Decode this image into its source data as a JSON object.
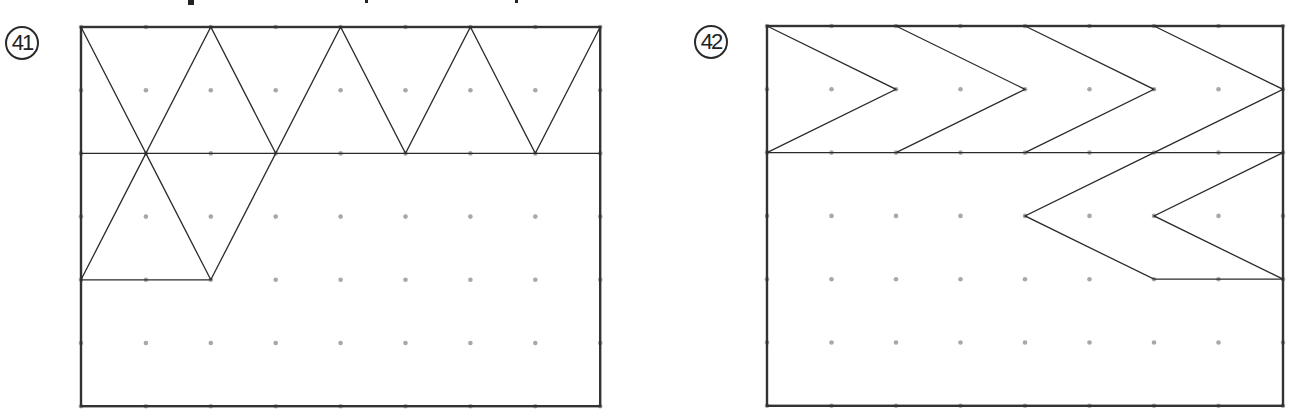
{
  "colors": {
    "line": "#2b2b2b",
    "dot": "#a8a8a8",
    "frame": "#333333",
    "background": "#ffffff"
  },
  "top_fragments": [
    {
      "x": 188,
      "y": 0,
      "w": 6,
      "h": 5
    },
    {
      "x": 365,
      "y": 0,
      "w": 3,
      "h": 3
    },
    {
      "x": 515,
      "y": 0,
      "w": 3,
      "h": 3
    }
  ],
  "problems": [
    {
      "number": "41",
      "label_pos": {
        "x": 5,
        "y": 26
      },
      "grid": {
        "origin_x": 81,
        "origin_y": 27,
        "dx": 64.9,
        "dy": 63.2,
        "cols": 9,
        "rows": 7
      },
      "polylines": [
        [
          [
            0,
            0
          ],
          [
            1,
            2
          ],
          [
            2,
            0
          ],
          [
            3,
            2
          ],
          [
            4,
            0
          ],
          [
            5,
            2
          ],
          [
            6,
            0
          ],
          [
            7,
            2
          ],
          [
            8,
            0
          ]
        ],
        [
          [
            0,
            2
          ],
          [
            8,
            2
          ]
        ],
        [
          [
            1,
            2
          ],
          [
            0,
            4
          ],
          [
            2,
            4
          ],
          [
            1,
            2
          ]
        ],
        [
          [
            2,
            4
          ],
          [
            3,
            2
          ]
        ]
      ]
    },
    {
      "number": "42",
      "label_pos": {
        "x": 694,
        "y": 25
      },
      "grid": {
        "origin_x": 767,
        "origin_y": 26,
        "dx": 64.5,
        "dy": 63.3,
        "cols": 9,
        "rows": 7
      },
      "polylines": [
        [
          [
            0,
            0
          ],
          [
            2,
            1
          ],
          [
            0,
            2
          ]
        ],
        [
          [
            2,
            0
          ],
          [
            4,
            1
          ],
          [
            2,
            2
          ]
        ],
        [
          [
            4,
            0
          ],
          [
            6,
            1
          ],
          [
            4,
            2
          ]
        ],
        [
          [
            6,
            0
          ],
          [
            8,
            1
          ],
          [
            6,
            2
          ]
        ],
        [
          [
            0,
            2
          ],
          [
            8,
            2
          ]
        ],
        [
          [
            8,
            2
          ],
          [
            6,
            3
          ],
          [
            8,
            4
          ]
        ],
        [
          [
            6,
            2
          ],
          [
            4,
            3
          ],
          [
            6,
            4
          ],
          [
            8,
            4
          ]
        ]
      ]
    }
  ]
}
